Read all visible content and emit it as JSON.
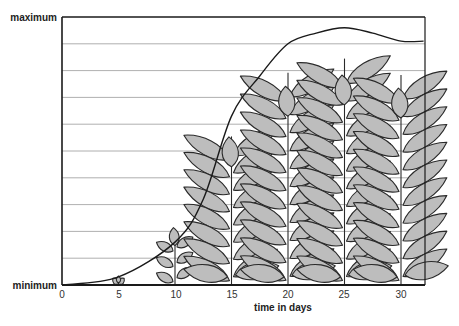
{
  "chart_data": {
    "type": "line",
    "title": "",
    "xlabel": "time in days",
    "ylabel": "",
    "x_ticks": [
      0,
      5,
      10,
      15,
      20,
      25,
      30
    ],
    "y_tick_labels": [
      "minimum",
      "maximum"
    ],
    "xlim": [
      0,
      32
    ],
    "ylim": [
      0,
      100
    ],
    "grid": {
      "horizontal": true,
      "vertical": false,
      "horizontal_lines": 10
    },
    "legend": null,
    "series": [
      {
        "name": "growth",
        "x": [
          0,
          5,
          10,
          12.5,
          15,
          17.5,
          20,
          22.5,
          25,
          27.5,
          30,
          32
        ],
        "values": [
          0,
          3,
          16,
          32,
          63,
          78,
          90,
          94,
          96,
          94,
          91,
          91
        ]
      }
    ],
    "annotations": [
      {
        "type": "plant-illustration",
        "day": 5,
        "relative_height": 3
      },
      {
        "type": "plant-illustration",
        "day": 10,
        "relative_height": 21
      },
      {
        "type": "plant-illustration",
        "day": 15,
        "relative_height": 63
      },
      {
        "type": "plant-illustration",
        "day": 20,
        "relative_height": 90
      },
      {
        "type": "plant-illustration",
        "day": 25,
        "relative_height": 96
      },
      {
        "type": "plant-illustration",
        "day": 30,
        "relative_height": 89
      }
    ]
  },
  "labels": {
    "y_max": "maximum",
    "y_min": "minimum",
    "x_axis": "time in days",
    "ticks": [
      "0",
      "5",
      "10",
      "15",
      "20",
      "25",
      "30"
    ]
  },
  "colors": {
    "leaf_fill": "#bdbdbd",
    "outline": "#2a2a2a",
    "grid": "#9a9a9a"
  }
}
